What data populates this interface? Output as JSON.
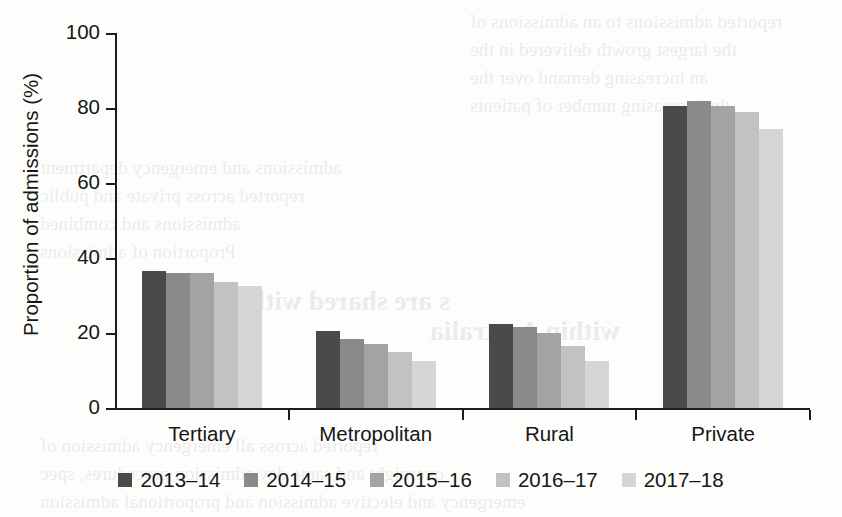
{
  "chart_data": {
    "type": "bar",
    "title": "",
    "subtitle": "",
    "xlabel": "",
    "ylabel": "Proportion of admissions (%)",
    "categories": [
      "Tertiary",
      "Metropolitan",
      "Rural",
      "Private"
    ],
    "series": [
      {
        "name": "2013–14",
        "color": "#4a4a4a",
        "values": [
          36.5,
          20.5,
          22.5,
          80.5
        ]
      },
      {
        "name": "2014–15",
        "color": "#8a8a8a",
        "values": [
          36.0,
          18.5,
          21.5,
          82.0
        ]
      },
      {
        "name": "2015–16",
        "color": "#a3a3a3",
        "values": [
          36.0,
          17.0,
          20.0,
          80.5
        ]
      },
      {
        "name": "2016–17",
        "color": "#c2c2c2",
        "values": [
          33.5,
          15.0,
          16.5,
          79.0
        ]
      },
      {
        "name": "2017–18",
        "color": "#d6d6d6",
        "values": [
          32.5,
          12.5,
          12.5,
          74.5
        ]
      }
    ],
    "ylim": [
      0,
      100
    ],
    "yticks": [
      0,
      20,
      40,
      60,
      80,
      100
    ],
    "ytick_labels": [
      "0",
      "20",
      "40",
      "60",
      "80",
      "100"
    ],
    "grid": false,
    "legend_position": "bottom"
  },
  "scan_artifacts": {
    "lines": [
      {
        "text": "reported admissions to an admissions of",
        "x": 470,
        "y": 6,
        "size": 19
      },
      {
        "text": "the largest growth delivered in the",
        "x": 470,
        "y": 34,
        "size": 19
      },
      {
        "text": "an increasing demand over the",
        "x": 470,
        "y": 62,
        "size": 19
      },
      {
        "text": "the increasing number of patients",
        "x": 470,
        "y": 90,
        "size": 19
      },
      {
        "text": "admissions and emergency department",
        "x": 40,
        "y": 152,
        "size": 19
      },
      {
        "text": "reported across private and public",
        "x": 40,
        "y": 180,
        "size": 19
      },
      {
        "text": "admissions and combined",
        "x": 40,
        "y": 208,
        "size": 19
      },
      {
        "text": "Proportion of admissions",
        "x": 40,
        "y": 236,
        "size": 19
      },
      {
        "text": "s are shared with",
        "x": 250,
        "y": 286,
        "size": 27
      },
      {
        "text": "within Australia",
        "x": 430,
        "y": 316,
        "size": 27
      },
      {
        "text": "reported across all emergency admission of",
        "x": 40,
        "y": 430,
        "size": 19
      },
      {
        "text": "overnight and same day admission procedures, spec",
        "x": 40,
        "y": 458,
        "size": 19
      },
      {
        "text": "emergency and elective admission and proportional admission",
        "x": 40,
        "y": 486,
        "size": 19
      }
    ]
  }
}
